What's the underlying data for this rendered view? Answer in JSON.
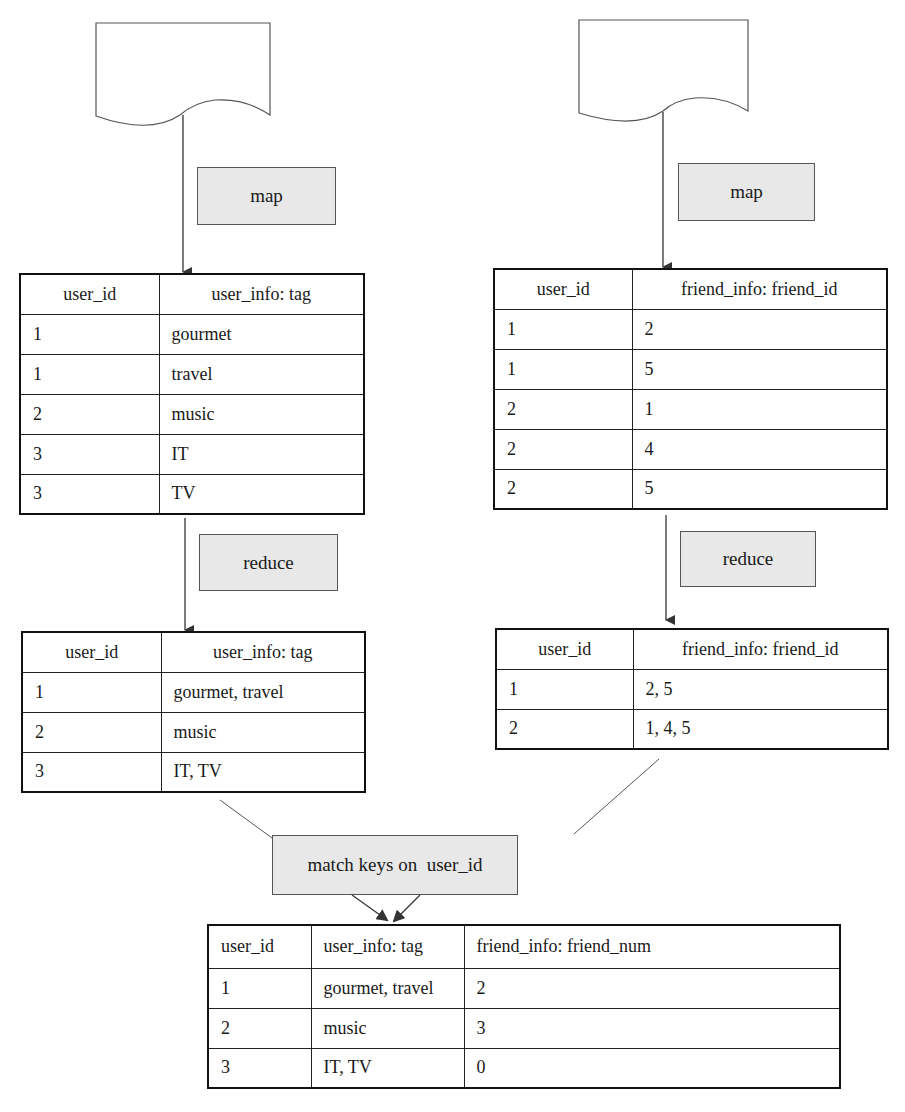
{
  "steps": {
    "map_left": "map",
    "map_right": "map",
    "reduce_left": "reduce",
    "reduce_right": "reduce",
    "match": "match keys on  user_id"
  },
  "user_map_table": {
    "headers": [
      "user_id",
      "user_info: tag"
    ],
    "rows": [
      [
        "1",
        "gourmet"
      ],
      [
        "1",
        "travel"
      ],
      [
        "2",
        "music"
      ],
      [
        "3",
        "IT"
      ],
      [
        "3",
        "TV"
      ]
    ]
  },
  "friend_map_table": {
    "headers": [
      "user_id",
      "friend_info: friend_id"
    ],
    "rows": [
      [
        "1",
        "2"
      ],
      [
        "1",
        "5"
      ],
      [
        "2",
        "1"
      ],
      [
        "2",
        "4"
      ],
      [
        "2",
        "5"
      ]
    ]
  },
  "user_reduce_table": {
    "headers": [
      "user_id",
      "user_info: tag"
    ],
    "rows": [
      [
        "1",
        "gourmet, travel"
      ],
      [
        "2",
        "music"
      ],
      [
        "3",
        "IT, TV"
      ]
    ]
  },
  "friend_reduce_table": {
    "headers": [
      "user_id",
      "friend_info: friend_id"
    ],
    "rows": [
      [
        "1",
        "2, 5"
      ],
      [
        "2",
        "1, 4, 5"
      ]
    ]
  },
  "result_table": {
    "headers": [
      "user_id",
      "user_info: tag",
      "friend_info: friend_num"
    ],
    "rows": [
      [
        "1",
        "gourmet, travel",
        "2"
      ],
      [
        "2",
        "music",
        "3"
      ],
      [
        "3",
        "IT, TV",
        "0"
      ]
    ]
  },
  "colors": {
    "box_fill": "#e8e8e8",
    "line": "#333333"
  }
}
